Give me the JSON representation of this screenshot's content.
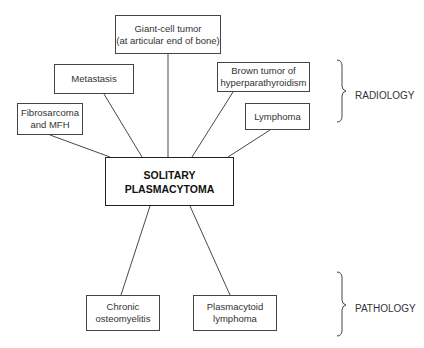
{
  "diagram": {
    "center": {
      "label": "SOLITARY\nPLASMACYTOMA"
    },
    "radiology_differentials": [
      {
        "label": "Giant-cell tumor\n(at articular end of bone)"
      },
      {
        "label": "Metastasis"
      },
      {
        "label": "Fibrosarcoma\nand MFH"
      },
      {
        "label": "Brown tumor of\nhyperparathyroidism"
      },
      {
        "label": "Lymphoma"
      }
    ],
    "pathology_differentials": [
      {
        "label": "Chronic\nosteomyelitis"
      },
      {
        "label": "Plasmacytoid\nlymphoma"
      }
    ],
    "groups": {
      "radiology": "RADIOLOGY",
      "pathology": "PATHOLOGY"
    },
    "colors": {
      "line": "#333333",
      "background": "#ffffff"
    }
  }
}
